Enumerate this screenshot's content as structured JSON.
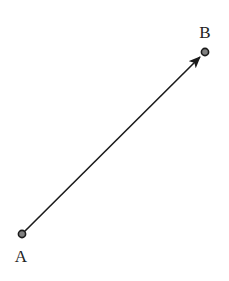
{
  "diagram": {
    "type": "vector",
    "points": [
      {
        "id": "A",
        "label": "A"
      },
      {
        "id": "B",
        "label": "B"
      }
    ],
    "vector": {
      "from": "A",
      "to": "B",
      "arrow": "end"
    },
    "colors": {
      "line": "#1a1a1a",
      "point_fill": "#808080",
      "point_stroke": "#1a1a1a",
      "label": "#222222"
    }
  }
}
